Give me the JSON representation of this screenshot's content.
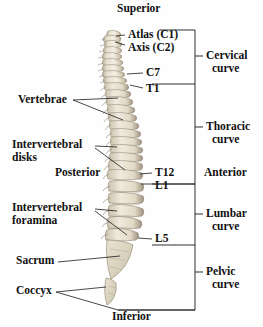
{
  "figure": {
    "background_color": "#fefefe",
    "bone_color": "#ded8c6",
    "bone_shadow_color": "#a89c86",
    "line_color": "#1a1a1a",
    "text_color": "#101010"
  },
  "orientation": {
    "superior": "Superior",
    "inferior": "Inferior",
    "anterior": "Anterior",
    "posterior": "Posterior"
  },
  "vertebra_labels": [
    {
      "id": "atlas",
      "text": "Atlas (C1)"
    },
    {
      "id": "axis",
      "text": "Axis (C2)"
    },
    {
      "id": "c7",
      "text": "C7"
    },
    {
      "id": "t1",
      "text": "T1"
    },
    {
      "id": "t12",
      "text": "T12"
    },
    {
      "id": "l1",
      "text": "L1"
    },
    {
      "id": "l5",
      "text": "L5"
    }
  ],
  "structure_labels": [
    {
      "id": "vertebrae",
      "line1": "Vertebrae",
      "line2": ""
    },
    {
      "id": "intervertebral-disks",
      "line1": "Intervertebral",
      "line2": "disks"
    },
    {
      "id": "intervertebral-foramina",
      "line1": "Intervertebral",
      "line2": "foramina"
    },
    {
      "id": "sacrum",
      "line1": "Sacrum",
      "line2": ""
    },
    {
      "id": "coccyx",
      "line1": "Coccyx",
      "line2": ""
    }
  ],
  "curves": [
    {
      "id": "cervical",
      "line1": "Cervical",
      "line2": "curve"
    },
    {
      "id": "thoracic",
      "line1": "Thoracic",
      "line2": "curve"
    },
    {
      "id": "lumbar",
      "line1": "Lumbar",
      "line2": "curve"
    },
    {
      "id": "pelvic",
      "line1": "Pelvic",
      "line2": "curve"
    }
  ]
}
